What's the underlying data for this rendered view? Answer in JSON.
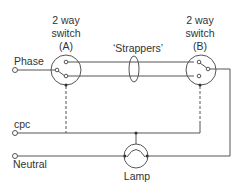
{
  "diagram": {
    "colors": {
      "line": "#555555",
      "text": "#333333",
      "background": "#ffffff"
    },
    "switch_a": {
      "line1": "2 way",
      "line2": "switch",
      "line3": "(A)"
    },
    "switch_b": {
      "line1": "2 way",
      "line2": "switch",
      "line3": "(B)"
    },
    "strappers_label": "‘Strappers’",
    "terminals": {
      "phase": "Phase",
      "cpc": "cpc",
      "neutral": "Neutral"
    },
    "lamp_label": "Lamp"
  }
}
